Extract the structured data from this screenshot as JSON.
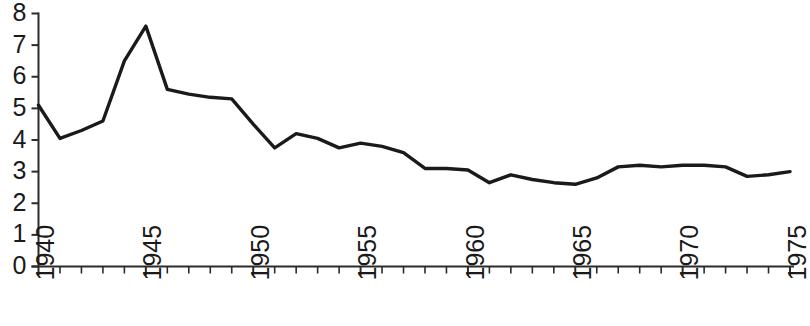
{
  "chart_data": {
    "type": "line",
    "title": "",
    "subtitle": "",
    "xlabel": "",
    "ylabel": "",
    "xlim": [
      1940,
      1975
    ],
    "ylim": [
      0,
      8
    ],
    "grid": false,
    "legend": null,
    "annotations": [],
    "y_ticks": [
      0,
      1,
      2,
      3,
      4,
      5,
      6,
      7,
      8
    ],
    "y_tick_labels": [
      "0",
      "1",
      "2",
      "3",
      "4",
      "5",
      "6",
      "7",
      "8"
    ],
    "x_ticks": [
      1940,
      1941,
      1942,
      1943,
      1944,
      1945,
      1946,
      1947,
      1948,
      1949,
      1950,
      1951,
      1952,
      1953,
      1954,
      1955,
      1956,
      1957,
      1958,
      1959,
      1960,
      1961,
      1962,
      1963,
      1964,
      1965,
      1966,
      1967,
      1968,
      1969,
      1970,
      1971,
      1972,
      1973,
      1974,
      1975
    ],
    "x_tick_labels_shown": [
      "1940",
      "1945",
      "1950",
      "1955",
      "1960",
      "1965",
      "1970",
      "1975"
    ],
    "x_tick_label_years": [
      1940,
      1945,
      1950,
      1955,
      1960,
      1965,
      1970,
      1975
    ],
    "line_color": "#1a1a1a",
    "x": [
      1940,
      1941,
      1942,
      1943,
      1944,
      1945,
      1946,
      1947,
      1948,
      1949,
      1950,
      1951,
      1952,
      1953,
      1954,
      1955,
      1956,
      1957,
      1958,
      1959,
      1960,
      1961,
      1962,
      1963,
      1964,
      1965,
      1966,
      1967,
      1968,
      1969,
      1970,
      1971,
      1972,
      1973,
      1974,
      1975
    ],
    "values": [
      5.1,
      4.05,
      4.3,
      4.6,
      6.5,
      7.6,
      5.6,
      5.45,
      5.35,
      5.3,
      4.5,
      3.75,
      4.2,
      4.05,
      3.75,
      3.9,
      3.8,
      3.6,
      3.1,
      3.1,
      3.05,
      2.65,
      2.9,
      2.75,
      2.65,
      2.6,
      2.8,
      3.15,
      3.2,
      3.15,
      3.2,
      3.2,
      3.15,
      2.85,
      2.9,
      3.0
    ]
  }
}
